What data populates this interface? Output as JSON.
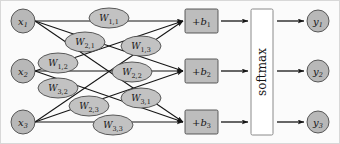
{
  "figure": {
    "background_color": "#fbfbfb",
    "border_color": "#d8d8d8",
    "node_fill": "#b8b8b8",
    "node_stroke": "#4a4a4a",
    "weight_fill": "#c2c2c2",
    "weight_stroke": "#4a4a4a",
    "bias_fill": "#bdbdbd",
    "bias_stroke": "#4a4a4a",
    "softmax_fill": "#ffffff",
    "softmax_stroke": "#8a8a8a",
    "arrow_color": "#151515"
  },
  "inputs": [
    {
      "id": "x1",
      "base": "x",
      "sub": "1",
      "cx": 22,
      "cy": 20,
      "r": 12
    },
    {
      "id": "x2",
      "base": "x",
      "sub": "2",
      "cx": 22,
      "cy": 70,
      "r": 12
    },
    {
      "id": "x3",
      "base": "x",
      "sub": "3",
      "cx": 22,
      "cy": 121,
      "r": 12
    }
  ],
  "outputs": [
    {
      "id": "y1",
      "base": "y",
      "sub": "1",
      "cx": 317,
      "cy": 20,
      "r": 11
    },
    {
      "id": "y2",
      "base": "y",
      "sub": "2",
      "cx": 317,
      "cy": 70,
      "r": 11
    },
    {
      "id": "y3",
      "base": "y",
      "sub": "3",
      "cx": 317,
      "cy": 121,
      "r": 11
    }
  ],
  "weights": [
    {
      "id": "W11",
      "base": "W",
      "sub": "1,1",
      "cx": 108,
      "cy": 17,
      "rx": 20,
      "ry": 10
    },
    {
      "id": "W21",
      "base": "W",
      "sub": "2,1",
      "cx": 84,
      "cy": 41,
      "rx": 20,
      "ry": 10
    },
    {
      "id": "W13",
      "base": "W",
      "sub": "1,3",
      "cx": 140,
      "cy": 45,
      "rx": 20,
      "ry": 10
    },
    {
      "id": "W12",
      "base": "W",
      "sub": "1,2",
      "cx": 57,
      "cy": 62,
      "rx": 20,
      "ry": 10
    },
    {
      "id": "W22",
      "base": "W",
      "sub": "2,2",
      "cx": 131,
      "cy": 71,
      "rx": 20,
      "ry": 10
    },
    {
      "id": "W32",
      "base": "W",
      "sub": "3,2",
      "cx": 57,
      "cy": 87,
      "rx": 20,
      "ry": 10
    },
    {
      "id": "W23",
      "base": "W",
      "sub": "2,3",
      "cx": 88,
      "cy": 105,
      "rx": 20,
      "ry": 10
    },
    {
      "id": "W31",
      "base": "W",
      "sub": "3,1",
      "cx": 140,
      "cy": 97,
      "rx": 20,
      "ry": 10
    },
    {
      "id": "W33",
      "base": "W",
      "sub": "3,3",
      "cx": 112,
      "cy": 124,
      "rx": 20,
      "ry": 10
    }
  ],
  "biases": [
    {
      "id": "b1",
      "prefix": "+",
      "base": "b",
      "sub": "1",
      "x": 184,
      "y": 8,
      "w": 33,
      "h": 24
    },
    {
      "id": "b2",
      "prefix": "+",
      "base": "b",
      "sub": "2",
      "x": 184,
      "y": 58,
      "w": 33,
      "h": 24
    },
    {
      "id": "b3",
      "prefix": "+",
      "base": "b",
      "sub": "3",
      "x": 184,
      "y": 109,
      "w": 33,
      "h": 24
    }
  ],
  "softmax": {
    "label": "softmax",
    "x": 250,
    "y": 8,
    "w": 22,
    "h": 126
  },
  "edges": [
    {
      "from": "x1",
      "to": "b1",
      "weight": "W11"
    },
    {
      "from": "x1",
      "to": "b2",
      "weight": "W12"
    },
    {
      "from": "x1",
      "to": "b3",
      "weight": "W13"
    },
    {
      "from": "x2",
      "to": "b1",
      "weight": "W21"
    },
    {
      "from": "x2",
      "to": "b2",
      "weight": "W22"
    },
    {
      "from": "x2",
      "to": "b3",
      "weight": "W23"
    },
    {
      "from": "x3",
      "to": "b1",
      "weight": "W31"
    },
    {
      "from": "x3",
      "to": "b2",
      "weight": "W32"
    },
    {
      "from": "x3",
      "to": "b3",
      "weight": "W33"
    }
  ],
  "connections": [
    {
      "from": "b1",
      "to": "softmax"
    },
    {
      "from": "b2",
      "to": "softmax"
    },
    {
      "from": "b3",
      "to": "softmax"
    },
    {
      "from": "softmax",
      "to": "y1"
    },
    {
      "from": "softmax",
      "to": "y2"
    },
    {
      "from": "softmax",
      "to": "y3"
    }
  ]
}
